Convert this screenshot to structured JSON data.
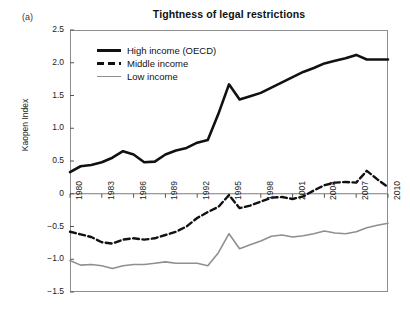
{
  "panel": {
    "letter": "(a)"
  },
  "chart_data": {
    "type": "line",
    "title": "Tightness of legal restrictions",
    "xlabel": "",
    "ylabel": "Kaopen Index",
    "ylim": [
      -1.5,
      2.5
    ],
    "xlim": [
      1980,
      2010
    ],
    "grid": false,
    "legend_position": "upper-left-inside",
    "ytick_labels": [
      "2.5",
      "2.0",
      "1.5",
      "1.0",
      "0.5",
      "0",
      "-0.5",
      "-1.0",
      "-1.5"
    ],
    "ytick_values": [
      2.5,
      2.0,
      1.5,
      1.0,
      0.5,
      0,
      -0.5,
      -1.0,
      -1.5
    ],
    "xtick_labels": [
      "1980",
      "1983",
      "1986",
      "1989",
      "1992",
      "1995",
      "1998",
      "2001",
      "2004",
      "2007",
      "2010"
    ],
    "xtick_values": [
      1980,
      1983,
      1986,
      1989,
      1992,
      1995,
      1998,
      2001,
      2004,
      2007,
      2010
    ],
    "x": [
      1980,
      1981,
      1982,
      1983,
      1984,
      1985,
      1986,
      1987,
      1988,
      1989,
      1990,
      1991,
      1992,
      1993,
      1994,
      1995,
      1996,
      1997,
      1998,
      1999,
      2000,
      2001,
      2002,
      2003,
      2004,
      2005,
      2006,
      2007,
      2008,
      2009,
      2010
    ],
    "series": [
      {
        "name": "High income (OECD)",
        "color": "#111111",
        "style": "solid",
        "width": 2.6,
        "values": [
          0.33,
          0.42,
          0.44,
          0.48,
          0.55,
          0.65,
          0.6,
          0.48,
          0.49,
          0.6,
          0.66,
          0.7,
          0.78,
          0.82,
          1.22,
          1.67,
          1.44,
          1.49,
          1.54,
          1.62,
          1.7,
          1.78,
          1.86,
          1.92,
          1.99,
          2.03,
          2.07,
          2.12,
          2.05,
          2.05,
          2.05
        ]
      },
      {
        "name": "Middle income",
        "color": "#111111",
        "style": "dashed",
        "width": 2.4,
        "values": [
          -0.58,
          -0.62,
          -0.66,
          -0.74,
          -0.76,
          -0.7,
          -0.68,
          -0.7,
          -0.68,
          -0.63,
          -0.58,
          -0.5,
          -0.37,
          -0.28,
          -0.2,
          -0.02,
          -0.22,
          -0.18,
          -0.12,
          -0.06,
          -0.05,
          -0.08,
          -0.04,
          0.05,
          0.13,
          0.17,
          0.18,
          0.17,
          0.35,
          0.22,
          0.1
        ]
      },
      {
        "name": "Low income",
        "color": "#8f8f8f",
        "style": "solid",
        "width": 1.6,
        "values": [
          -1.02,
          -1.09,
          -1.08,
          -1.1,
          -1.14,
          -1.1,
          -1.08,
          -1.08,
          -1.06,
          -1.04,
          -1.06,
          -1.06,
          -1.06,
          -1.1,
          -0.9,
          -0.61,
          -0.84,
          -0.78,
          -0.72,
          -0.65,
          -0.63,
          -0.66,
          -0.64,
          -0.61,
          -0.57,
          -0.6,
          -0.61,
          -0.58,
          -0.52,
          -0.48,
          -0.45
        ]
      }
    ]
  }
}
